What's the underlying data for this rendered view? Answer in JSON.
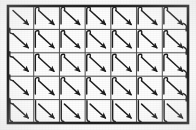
{
  "figure": {
    "type": "diagram",
    "background_color": "#fdfdfd",
    "ink_color": "#1a1a1a",
    "grid_line_color": "#4a4a4a",
    "border_color": "#111111"
  },
  "canvas": {
    "width": 196,
    "height": 130
  },
  "frame": {
    "x": 8,
    "y": 6,
    "width": 180,
    "height": 117,
    "border_width": 2.6
  },
  "grid": {
    "columns": 7,
    "rows": 5,
    "cell_width": 25.7,
    "cell_height": 23.4,
    "line_width": 1.0,
    "label": "7 x 5 cell decomposition"
  },
  "arrow": {
    "direction": "down-right",
    "stroke_width": 1.5,
    "head_length": 5.2,
    "head_width": 3.6,
    "count": 35,
    "color": "#1a1a1a"
  },
  "connector": {
    "style": "curved-hook",
    "stroke_width": 1.4,
    "right_wrap_radius": 7.5,
    "left_wrap_radius": 6.5,
    "bottom_hook_depth": 6.0,
    "color": "#1a1a1a"
  },
  "path": {
    "pattern": "serpentine",
    "start_cell": "row-1-col-1",
    "end_cell": "row-5-col-7",
    "cells": [
      {
        "row": 1,
        "col": 1,
        "hook": "none"
      },
      {
        "row": 1,
        "col": 2,
        "hook": "top-left"
      },
      {
        "row": 1,
        "col": 3,
        "hook": "top-left"
      },
      {
        "row": 1,
        "col": 4,
        "hook": "top-left"
      },
      {
        "row": 1,
        "col": 5,
        "hook": "top-left"
      },
      {
        "row": 1,
        "col": 6,
        "hook": "top-left"
      },
      {
        "row": 1,
        "col": 7,
        "hook": "top-left-wrap-right"
      },
      {
        "row": 2,
        "col": 1,
        "hook": "left-wrap"
      },
      {
        "row": 2,
        "col": 2,
        "hook": "top-left"
      },
      {
        "row": 2,
        "col": 3,
        "hook": "top-left"
      },
      {
        "row": 2,
        "col": 4,
        "hook": "top-left"
      },
      {
        "row": 2,
        "col": 5,
        "hook": "top-left"
      },
      {
        "row": 2,
        "col": 6,
        "hook": "top-left"
      },
      {
        "row": 2,
        "col": 7,
        "hook": "top-left-wrap-right"
      },
      {
        "row": 3,
        "col": 1,
        "hook": "left-wrap"
      },
      {
        "row": 3,
        "col": 2,
        "hook": "top-left"
      },
      {
        "row": 3,
        "col": 3,
        "hook": "top-left"
      },
      {
        "row": 3,
        "col": 4,
        "hook": "top-left"
      },
      {
        "row": 3,
        "col": 5,
        "hook": "top-left"
      },
      {
        "row": 3,
        "col": 6,
        "hook": "top-left"
      },
      {
        "row": 3,
        "col": 7,
        "hook": "top-left-wrap-right"
      },
      {
        "row": 4,
        "col": 1,
        "hook": "left-wrap"
      },
      {
        "row": 4,
        "col": 2,
        "hook": "top-left"
      },
      {
        "row": 4,
        "col": 3,
        "hook": "top-left"
      },
      {
        "row": 4,
        "col": 4,
        "hook": "top-left"
      },
      {
        "row": 4,
        "col": 5,
        "hook": "top-left"
      },
      {
        "row": 4,
        "col": 6,
        "hook": "top-left"
      },
      {
        "row": 4,
        "col": 7,
        "hook": "top-left-wrap-right"
      },
      {
        "row": 5,
        "col": 1,
        "hook": "left-wrap-bottom"
      },
      {
        "row": 5,
        "col": 2,
        "hook": "bottom-hook"
      },
      {
        "row": 5,
        "col": 3,
        "hook": "bottom-hook"
      },
      {
        "row": 5,
        "col": 4,
        "hook": "bottom-hook"
      },
      {
        "row": 5,
        "col": 5,
        "hook": "bottom-hook"
      },
      {
        "row": 5,
        "col": 6,
        "hook": "bottom-hook"
      },
      {
        "row": 5,
        "col": 7,
        "hook": "bottom-hook"
      }
    ]
  }
}
